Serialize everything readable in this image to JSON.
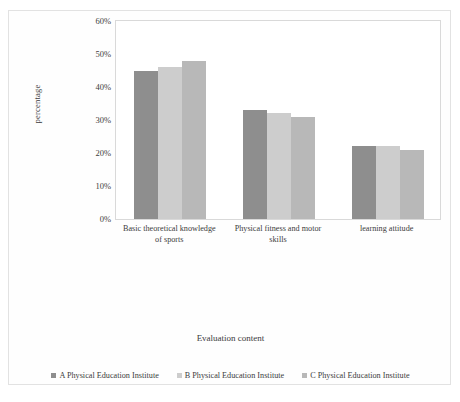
{
  "chart_data": {
    "type": "bar",
    "title": "",
    "subtitle": "",
    "xlabel": "Evaluation content",
    "ylabel": "percentage",
    "categories": [
      "Basic theoretical knowledge of sports",
      "Physical fitness and motor skills",
      "learning attitude"
    ],
    "series": [
      {
        "name": "A Physical Education Institute",
        "values": [
          45,
          33,
          22
        ],
        "color": "#8e8e8e"
      },
      {
        "name": "B Physical Education Institute",
        "values": [
          46,
          32,
          22
        ],
        "color": "#cdcdcd"
      },
      {
        "name": "C Physical Education Institute",
        "values": [
          48,
          31,
          21
        ],
        "color": "#b8b8b8"
      }
    ],
    "ylim": [
      0,
      60
    ],
    "yticks": [
      "0%",
      "10%",
      "20%",
      "30%",
      "40%",
      "50%",
      "60%"
    ],
    "ytick_values": [
      0,
      10,
      20,
      30,
      40,
      50,
      60
    ],
    "grid": false,
    "legend_position": "bottom"
  },
  "axes": {
    "y_title": "percentage",
    "x_title": "Evaluation content"
  },
  "category_labels": [
    {
      "line1": "Basic theoretical knowledge",
      "line2": "of sports"
    },
    {
      "line1": "Physical fitness and motor",
      "line2": "skills"
    },
    {
      "line1": "learning attitude",
      "line2": ""
    }
  ],
  "legend": {
    "items": [
      {
        "label": "A Physical Education Institute",
        "color": "#8e8e8e"
      },
      {
        "label": "B Physical Education Institute",
        "color": "#cdcdcd"
      },
      {
        "label": "C Physical Education Institute",
        "color": "#b8b8b8"
      }
    ]
  }
}
